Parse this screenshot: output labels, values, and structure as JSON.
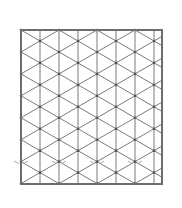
{
  "diagram": {
    "title": "Isometric triangular grid",
    "frame": {
      "x": 21,
      "y": 30,
      "width": 141,
      "height": 154
    },
    "grid": {
      "vertical_spacing": 19,
      "angle_deg": 30,
      "first_vertical_x": 21
    },
    "colors": {
      "background": "#ffffff",
      "line": "#7a7a7a",
      "frame": "#6e6e6e",
      "vertex": "#555555",
      "faint": "#b0b0b0"
    },
    "faint_row_y": 165
  }
}
